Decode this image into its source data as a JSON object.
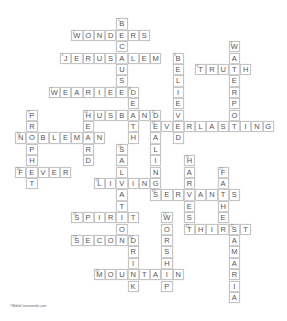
{
  "puzzle": {
    "type": "crossword",
    "grid": {
      "origin_x": 15,
      "origin_y": 18.3,
      "cell_w": 11.25,
      "cell_h": 11.4
    },
    "colors": {
      "tile_border": "#c4c4c4",
      "tile_fill": "#ffffff",
      "letter": "#555555",
      "number": "#777777"
    },
    "words": [
      {
        "num": 1,
        "answer": "BECAUSE",
        "dir": "down",
        "row": 0,
        "col": 9
      },
      {
        "num": 2,
        "answer": "WONDERS",
        "dir": "across",
        "row": 1,
        "col": 5
      },
      {
        "num": 3,
        "answer": "WATERPOT",
        "dir": "down",
        "row": 2,
        "col": 19
      },
      {
        "num": 4,
        "answer": "JERUSALEM",
        "dir": "across",
        "row": 3,
        "col": 4
      },
      {
        "num": 5,
        "answer": "BELIEVED",
        "dir": "down",
        "row": 3,
        "col": 14
      },
      {
        "num": 6,
        "answer": "TRUTH",
        "dir": "across",
        "row": 4,
        "col": 16
      },
      {
        "num": 7,
        "answer": "WEARIED",
        "dir": "across",
        "row": 6,
        "col": 3
      },
      {
        "num": 8,
        "answer": "DEATH",
        "dir": "down",
        "row": 6,
        "col": 10
      },
      {
        "num": 9,
        "answer": "PROPHET",
        "dir": "down",
        "row": 8,
        "col": 1
      },
      {
        "num": 10,
        "answer": "HUSBAND",
        "dir": "across",
        "row": 8,
        "col": 6
      },
      {
        "num": 10,
        "answer": "HEARD",
        "dir": "down",
        "row": 8,
        "col": 6
      },
      {
        "num": 11,
        "answer": "DEALINGS",
        "dir": "down",
        "row": 8,
        "col": 12
      },
      {
        "num": 12,
        "answer": "EVERLASTING",
        "dir": "across",
        "row": 9,
        "col": 12
      },
      {
        "num": 13,
        "answer": "NOBLEMAN",
        "dir": "across",
        "row": 10,
        "col": 0
      },
      {
        "num": 14,
        "answer": "SALVATION",
        "dir": "down",
        "row": 11,
        "col": 9
      },
      {
        "num": 15,
        "answer": "HARVEST",
        "dir": "down",
        "row": 12,
        "col": 15
      },
      {
        "num": 16,
        "answer": "FEVER",
        "dir": "across",
        "row": 13,
        "col": 0
      },
      {
        "num": 17,
        "answer": "FATHER",
        "dir": "down",
        "row": 13,
        "col": 18
      },
      {
        "num": 18,
        "answer": "LIVING",
        "dir": "across",
        "row": 14,
        "col": 7
      },
      {
        "num": 19,
        "answer": "SERVANTS",
        "dir": "across",
        "row": 15,
        "col": 12
      },
      {
        "num": 20,
        "answer": "SPIRIT",
        "dir": "across",
        "row": 17,
        "col": 5
      },
      {
        "num": 21,
        "answer": "WORSHIP",
        "dir": "down",
        "row": 17,
        "col": 13
      },
      {
        "num": 22,
        "answer": "THIRST",
        "dir": "across",
        "row": 18,
        "col": 15
      },
      {
        "num": 22,
        "answer": "SAMARIA",
        "dir": "down",
        "row": 18,
        "col": 19
      },
      {
        "num": 23,
        "answer": "SECOND",
        "dir": "across",
        "row": 19,
        "col": 5
      },
      {
        "num": 24,
        "answer": "DRINK",
        "dir": "down",
        "row": 19,
        "col": 10
      },
      {
        "num": 25,
        "answer": "MOUNTAIN",
        "dir": "across",
        "row": 22,
        "col": 7
      }
    ]
  },
  "footer": {
    "text": "©BibleCrosswords.com"
  }
}
